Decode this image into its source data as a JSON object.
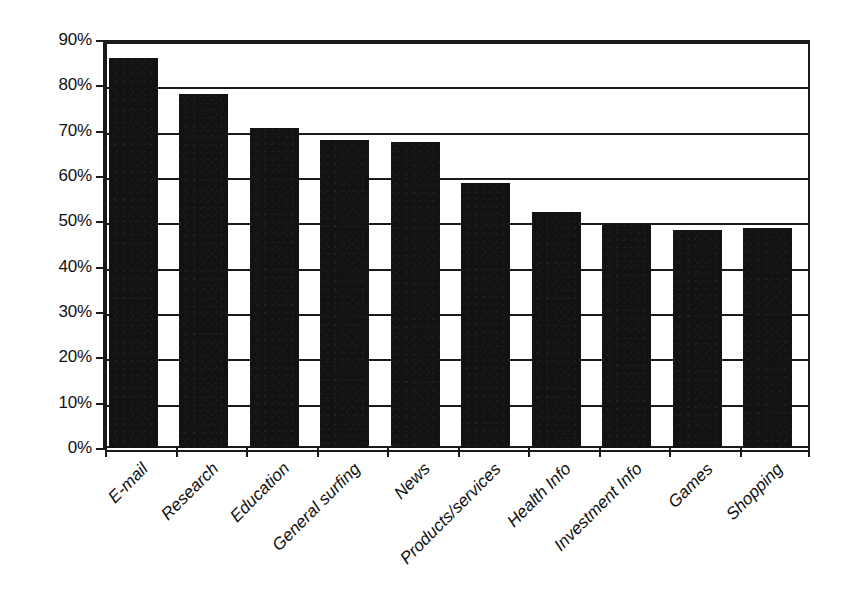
{
  "chart_data": {
    "type": "bar",
    "title": "",
    "subtitle": "",
    "xlabel": "",
    "ylabel": "",
    "ylim": [
      0,
      90
    ],
    "ytick_labels": [
      "90%",
      "80%",
      "70%",
      "60%",
      "50%",
      "40%",
      "30%",
      "20%",
      "10%",
      "0%"
    ],
    "ytick_values": [
      90,
      80,
      70,
      60,
      50,
      40,
      30,
      20,
      10,
      0
    ],
    "grid": "horizontal",
    "legend": "none",
    "value_unit": "%",
    "bar_color": "#121212",
    "axis_color": "#1a1a1a",
    "background_color": "#ffffff",
    "categories": [
      "E-mail",
      "Research",
      "Education",
      "General surfing",
      "News",
      "Products/services",
      "Health Info",
      "Investment Info",
      "Games",
      "Shopping"
    ],
    "values": [
      86,
      78,
      70.5,
      68,
      67.5,
      58.5,
      52,
      49.5,
      48,
      48.5
    ]
  }
}
